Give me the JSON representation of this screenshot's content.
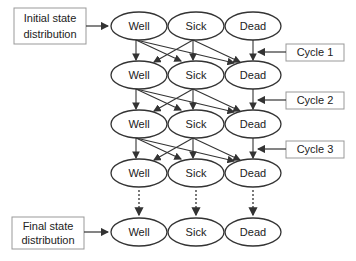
{
  "states": [
    "Well",
    "Sick",
    "Dead"
  ],
  "rows": [
    {
      "states": [
        "Well",
        "Sick",
        "Dead"
      ]
    },
    {
      "states": [
        "Well",
        "Sick",
        "Dead"
      ]
    },
    {
      "states": [
        "Well",
        "Sick",
        "Dead"
      ]
    },
    {
      "states": [
        "Well",
        "Sick",
        "Dead"
      ]
    },
    {
      "states": [
        "Well",
        "Sick",
        "Dead"
      ]
    }
  ],
  "labels": {
    "initial_line1": "Initial state",
    "initial_line2": "distribution",
    "final_line1": "Final state",
    "final_line2": "distribution",
    "cycles": [
      "Cycle 1",
      "Cycle 2",
      "Cycle 3"
    ]
  },
  "transitions": [
    {
      "from": "Well",
      "to": [
        "Well",
        "Sick",
        "Dead"
      ]
    },
    {
      "from": "Sick",
      "to": [
        "Well",
        "Sick",
        "Dead"
      ]
    },
    {
      "from": "Dead",
      "to": [
        "Dead"
      ]
    }
  ],
  "colors": {
    "stroke": "#333333",
    "box_border": "#999999",
    "text": "#222222"
  }
}
